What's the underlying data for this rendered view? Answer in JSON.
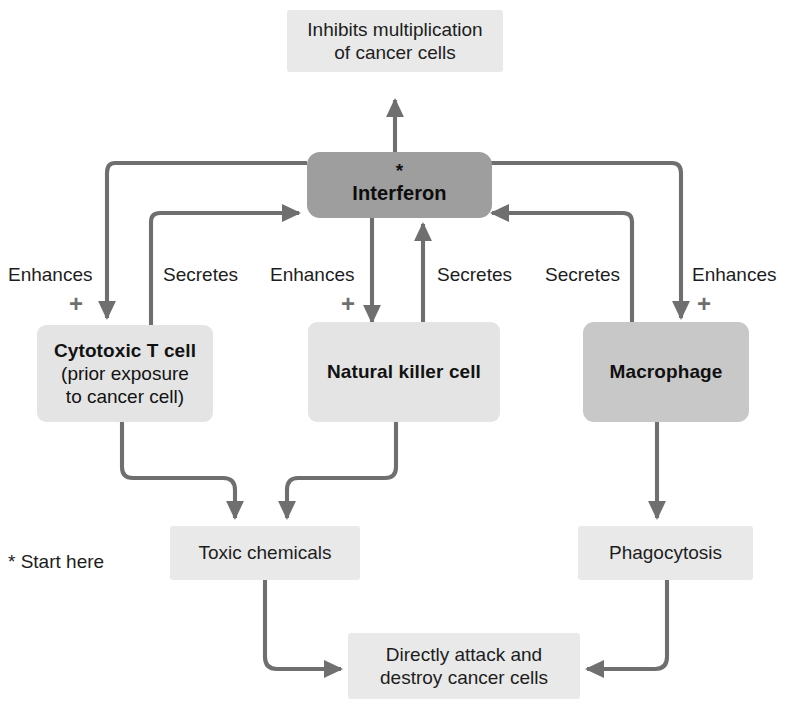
{
  "diagram": {
    "colors": {
      "arrow": "#6f6f6f",
      "light_box": "#e9e9e9",
      "cell_box": "#e4e4e4",
      "cell_box_dark": "#c8c8c8",
      "interferon_box": "#9e9e9e",
      "text": "#1d1d1d",
      "plus": "#6f6f6f",
      "background": "#ffffff"
    }
  },
  "nodes": {
    "inhibits": {
      "line1": "Inhibits multiplication",
      "line2": "of cancer cells"
    },
    "interferon": {
      "asterisk": "*",
      "label": "Interferon"
    },
    "cytotoxic_t_cell": {
      "title": "Cytotoxic T cell",
      "sub1": "(prior exposure",
      "sub2": "to cancer cell)"
    },
    "natural_killer_cell": {
      "title": "Natural killer cell"
    },
    "macrophage": {
      "title": "Macrophage"
    },
    "toxic_chemicals": {
      "label": "Toxic chemicals"
    },
    "phagocytosis": {
      "label": "Phagocytosis"
    },
    "directly_attack": {
      "line1": "Directly attack and",
      "line2": "destroy cancer cells"
    }
  },
  "edge_labels": {
    "enhances_t_cell": "Enhances",
    "secretes_t_cell": "Secretes",
    "enhances_nk_cell": "Enhances",
    "secretes_nk_cell": "Secretes",
    "secretes_macrophage": "Secretes",
    "enhances_macrophage": "Enhances"
  },
  "plus_signs": {
    "t_cell": "+",
    "nk_cell": "+",
    "macrophage": "+"
  },
  "footnote": {
    "text": "* Start here"
  }
}
